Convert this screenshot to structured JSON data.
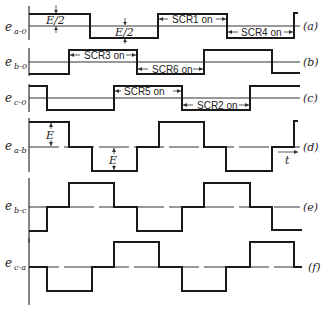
{
  "figure": {
    "type": "six-step inverter voltage waveforms",
    "time_label": "t",
    "colors": {
      "ink": "#1a1a1a",
      "background": "#ffffff"
    }
  },
  "panels": [
    {
      "id": "a",
      "tag": "(a)",
      "label_main": "e",
      "label_sub": "a-0",
      "kind": "phase",
      "levels": [
        1,
        -1,
        1,
        -1,
        1
      ],
      "steps": [
        0,
        3,
        6,
        9,
        12,
        12.4
      ],
      "annotations": [
        {
          "text": "E/2",
          "kind": "amplitude-up"
        },
        {
          "text": "E/2",
          "kind": "amplitude-down"
        }
      ],
      "intervals": [
        {
          "text": "SCR1 on",
          "from": 6,
          "to": 9,
          "level": 1
        },
        {
          "text": "SCR4 on",
          "from": 9,
          "to": 12,
          "level": -1
        }
      ]
    },
    {
      "id": "b",
      "tag": "(b)",
      "label_main": "e",
      "label_sub": "b-0",
      "kind": "phase",
      "levels": [
        -1,
        1,
        -1,
        1,
        -1
      ],
      "steps": [
        0,
        1,
        4,
        7,
        10,
        11.4
      ],
      "intervals": [
        {
          "text": "SCR3 on",
          "from": 1,
          "to": 4,
          "level": 1
        },
        {
          "text": "SCR6 on",
          "from": 4,
          "to": 7,
          "level": -1
        }
      ]
    },
    {
      "id": "c",
      "tag": "(c)",
      "label_main": "e",
      "label_sub": "c-0",
      "kind": "phase",
      "levels": [
        1,
        -1,
        1,
        -1,
        1
      ],
      "steps": [
        0,
        1,
        3,
        5,
        8,
        11.4
      ],
      "intervals": [
        {
          "text": "SCR5 on",
          "from": 3,
          "to": 5,
          "level": 1
        },
        {
          "text": "SCR2 on",
          "from": 5,
          "to": 8,
          "level": -1
        }
      ]
    },
    {
      "id": "d",
      "tag": "(d)",
      "label_main": "e",
      "label_sub": "a-b",
      "kind": "line",
      "levels": [
        1,
        0,
        -1,
        0,
        1,
        0,
        -1,
        0,
        1
      ],
      "annotations": [
        {
          "text": "E",
          "kind": "amplitude-up"
        },
        {
          "text": "E",
          "kind": "amplitude-down"
        }
      ]
    },
    {
      "id": "e",
      "tag": "(e)",
      "label_main": "e",
      "label_sub": "b-c",
      "kind": "line",
      "levels": [
        -1,
        0,
        1,
        0,
        -1,
        0,
        1,
        0,
        -1
      ]
    },
    {
      "id": "f",
      "tag": "(f)",
      "label_main": "e",
      "label_sub": "c-a",
      "kind": "line",
      "levels": [
        0,
        -1,
        0,
        1,
        0,
        -1,
        0,
        1,
        0
      ]
    }
  ]
}
